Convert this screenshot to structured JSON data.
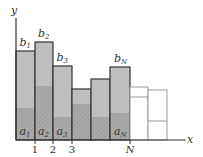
{
  "diagram": {
    "axes": {
      "x_label": "x",
      "y_label": "y",
      "ticks": [
        {
          "label": "1",
          "x": 35
        },
        {
          "label": "2",
          "x": 53
        },
        {
          "label": "3",
          "x": 72
        },
        {
          "label": "N",
          "x": 130
        }
      ]
    },
    "bars": [
      {
        "x0": 16,
        "x1": 35,
        "top": 51,
        "hatch_top": 108,
        "top_label": "b",
        "top_sub": "1",
        "bottom_label": "a",
        "bottom_sub": "1",
        "filled": true
      },
      {
        "x0": 35,
        "x1": 53,
        "top": 42,
        "hatch_top": 86,
        "top_label": "b",
        "top_sub": "2",
        "bottom_label": "a",
        "bottom_sub": "2",
        "filled": true
      },
      {
        "x0": 53,
        "x1": 72,
        "top": 66,
        "hatch_top": 117,
        "top_label": "b",
        "top_sub": "3",
        "bottom_label": "a",
        "bottom_sub": "3",
        "filled": true
      },
      {
        "x0": 72,
        "x1": 91,
        "top": 89,
        "hatch_top": 104,
        "top_label": "",
        "top_sub": "",
        "bottom_label": "",
        "bottom_sub": "",
        "filled": true
      },
      {
        "x0": 91,
        "x1": 110,
        "top": 79,
        "hatch_top": 117,
        "top_label": "",
        "top_sub": "",
        "bottom_label": "",
        "bottom_sub": "",
        "filled": true
      },
      {
        "x0": 110,
        "x1": 130,
        "top": 67,
        "hatch_top": 113,
        "top_label": "b",
        "top_sub": "N",
        "bottom_label": "a",
        "bottom_sub": "N",
        "filled": true
      },
      {
        "x0": 130,
        "x1": 148,
        "top": 87,
        "hatch_top": 97,
        "top_label": "",
        "top_sub": "",
        "bottom_label": "",
        "bottom_sub": "",
        "filled": false
      },
      {
        "x0": 148,
        "x1": 167,
        "top": 90,
        "hatch_top": 121,
        "top_label": "",
        "top_sub": "",
        "bottom_label": "",
        "bottom_sub": "",
        "filled": false
      }
    ],
    "colors": {
      "fill": "#bebebe",
      "hatch_fill": "#ababab",
      "stroke": "#333333",
      "outline_stroke": "#999999"
    }
  }
}
